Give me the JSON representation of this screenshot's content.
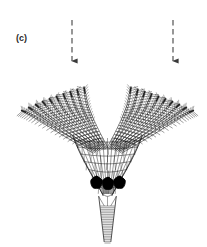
{
  "figure": {
    "panel_label": "(c)",
    "caption_text": "",
    "ink_color": "#1a1a1a",
    "fill_color": "#000000",
    "background_color": "#ffffff",
    "arrow_color": "#3a3a3a"
  },
  "arrows": [
    {
      "name": "left-flow-arrow",
      "label": "",
      "x": 72,
      "y_top": 20,
      "y_tip": 68,
      "style": "dashed",
      "direction": "down"
    },
    {
      "name": "right-flow-arrow",
      "label": "",
      "x": 173,
      "y_top": 20,
      "y_tip": 68,
      "style": "dashed",
      "direction": "down"
    }
  ],
  "anatomy": {
    "crown": {
      "label": "",
      "arm_count": 20,
      "x_left": 38,
      "x_right": 185,
      "y_top": 88,
      "y_bottom": 155
    },
    "calyx": {
      "label": "",
      "plate_rows": 5,
      "black_plate_count": 3,
      "x_center": 107,
      "y_top": 140,
      "y_bottom": 196
    },
    "stem": {
      "label": "",
      "columnal_count": 22,
      "x_center": 107,
      "y_top": 196,
      "y_bottom": 243,
      "width_top": 18,
      "width_bottom": 7
    }
  }
}
